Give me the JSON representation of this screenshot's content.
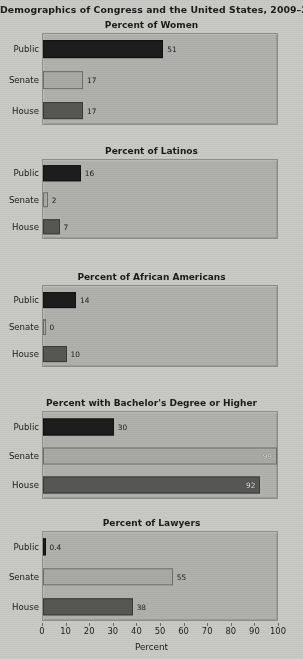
{
  "figure": {
    "title": "Demographics of Congress and the United States, 2009–2011",
    "axis_title": "Percent",
    "background_color": "#c9c9c6",
    "panel_color": "#b0b0ad"
  },
  "series_colors": {
    "Public": "#1d1d1d",
    "Senate": "#a9a9a6",
    "House": "#575755"
  },
  "axis": {
    "ticks": [
      "0",
      "10",
      "20",
      "30",
      "40",
      "50",
      "60",
      "70",
      "80",
      "90",
      "100"
    ],
    "min": 0,
    "max": 100
  },
  "categories": [
    "Public",
    "Senate",
    "House"
  ],
  "chart_data": [
    {
      "type": "bar",
      "title": "Percent of Women",
      "xlabel": "Percent",
      "ylabel": "",
      "orientation": "horizontal",
      "categories": [
        "Public",
        "Senate",
        "House"
      ],
      "values": [
        51,
        17,
        17
      ],
      "labels": [
        "51",
        "17",
        "17"
      ],
      "xlim": [
        0,
        100
      ],
      "grid": false,
      "legend": "none"
    },
    {
      "type": "bar",
      "title": "Percent of Latinos",
      "xlabel": "Percent",
      "ylabel": "",
      "orientation": "horizontal",
      "categories": [
        "Public",
        "Senate",
        "House"
      ],
      "values": [
        16,
        2,
        7
      ],
      "labels": [
        "16",
        "2",
        "7"
      ],
      "xlim": [
        0,
        100
      ],
      "grid": false,
      "legend": "none"
    },
    {
      "type": "bar",
      "title": "Percent of African Americans",
      "xlabel": "Percent",
      "ylabel": "",
      "orientation": "horizontal",
      "categories": [
        "Public",
        "Senate",
        "House"
      ],
      "values": [
        14,
        0,
        10
      ],
      "labels": [
        "14",
        "0",
        "10"
      ],
      "xlim": [
        0,
        100
      ],
      "grid": false,
      "legend": "none"
    },
    {
      "type": "bar",
      "title": "Percent with Bachelor's Degree or Higher",
      "xlabel": "Percent",
      "ylabel": "",
      "orientation": "horizontal",
      "categories": [
        "Public",
        "Senate",
        "House"
      ],
      "values": [
        30,
        99,
        92
      ],
      "labels": [
        "30",
        "99",
        "92"
      ],
      "xlim": [
        0,
        100
      ],
      "grid": false,
      "legend": "none"
    },
    {
      "type": "bar",
      "title": "Percent of Lawyers",
      "xlabel": "Percent",
      "ylabel": "",
      "orientation": "horizontal",
      "categories": [
        "Public",
        "Senate",
        "House"
      ],
      "values": [
        0.4,
        55,
        38
      ],
      "labels": [
        "0.4",
        "55",
        "38"
      ],
      "xlim": [
        0,
        100
      ],
      "grid": false,
      "legend": "none"
    }
  ],
  "panel_layout": [
    {
      "top": 20,
      "title_h": 14,
      "plot_h": 92
    },
    {
      "top": 146,
      "title_h": 14,
      "plot_h": 80
    },
    {
      "top": 272,
      "title_h": 14,
      "plot_h": 82
    },
    {
      "top": 398,
      "title_h": 14,
      "plot_h": 88
    },
    {
      "top": 518,
      "title_h": 14,
      "plot_h": 90
    }
  ]
}
